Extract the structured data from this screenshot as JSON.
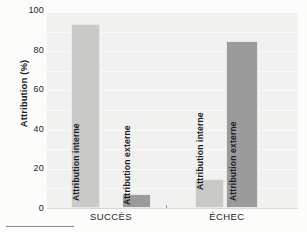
{
  "chart_data": {
    "type": "bar",
    "title": "",
    "xlabel": "",
    "ylabel": "Attribution (%)",
    "ylim": [
      0,
      100
    ],
    "yticks": [
      0,
      20,
      40,
      60,
      80,
      100
    ],
    "ytick_labels": [
      "0",
      "20",
      "40",
      "60",
      "80",
      "100"
    ],
    "categories": [
      "SUCCÈS",
      "ÉCHEC"
    ],
    "grid": true,
    "legend": "none (series labelled inside bars)",
    "series": [
      {
        "name": "Attribution interne",
        "values": [
          94,
          15
        ]
      },
      {
        "name": "Attribution externe",
        "values": [
          7,
          85
        ]
      }
    ],
    "bars": [
      {
        "group": "SUCCÈS",
        "series": "Attribution interne",
        "value": 94,
        "color": "#c9c9c7",
        "label": "Attribution interne"
      },
      {
        "group": "SUCCÈS",
        "series": "Attribution externe",
        "value": 7,
        "color": "#9b9b9b",
        "label": "Attribution externe"
      },
      {
        "group": "ÉCHEC",
        "series": "Attribution interne",
        "value": 15,
        "color": "#c9c9c7",
        "label": "Attribution interne"
      },
      {
        "group": "ÉCHEC",
        "series": "Attribution externe",
        "value": 85,
        "color": "#9b9b9b",
        "label": "Attribution externe"
      }
    ],
    "colors": {
      "interne": "#c9c9c7",
      "externe": "#9b9b9b",
      "plot_background": "#f1f1ef",
      "gridline": "#fafafa",
      "text": "#1b1b1b"
    }
  }
}
